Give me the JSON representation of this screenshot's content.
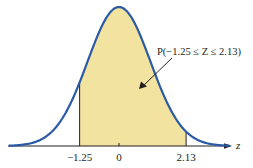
{
  "figure": {
    "type": "standard-normal-curve",
    "axis_variable": "z",
    "shaded_region": {
      "lower": -1.25,
      "upper": 2.13
    },
    "annotation": "P(−1.25 ≤ Z ≤ 2.13)",
    "tick_labels": [
      {
        "value": -1.25,
        "text": "−1.25"
      },
      {
        "value": 0,
        "text": "0"
      },
      {
        "value": 2.13,
        "text": "2.13"
      }
    ],
    "colors": {
      "curve": "#2b5aa6",
      "fill": "#f3e3a0",
      "axis": "#231f20",
      "text": "#231f20"
    }
  }
}
